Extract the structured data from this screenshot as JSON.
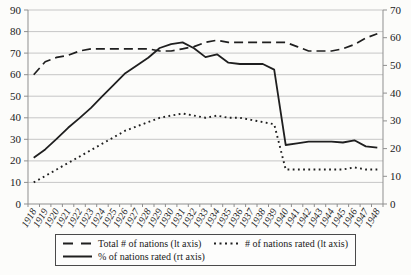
{
  "chart_data": {
    "type": "line",
    "x": [
      1918,
      1919,
      1920,
      1921,
      1922,
      1923,
      1924,
      1925,
      1926,
      1927,
      1928,
      1929,
      1930,
      1931,
      1932,
      1933,
      1934,
      1935,
      1936,
      1937,
      1938,
      1939,
      1940,
      1941,
      1942,
      1943,
      1944,
      1945,
      1946,
      1947,
      1948
    ],
    "series": [
      {
        "name": "Total # of nations (lt axis)",
        "axis": "left",
        "style": "dashed",
        "values": [
          60,
          66,
          68,
          69,
          71,
          72,
          72,
          72,
          72,
          72,
          72,
          71,
          71,
          72,
          73,
          75,
          76,
          75,
          75,
          75,
          75,
          75,
          75,
          73,
          71,
          71,
          71,
          72,
          74,
          77,
          79
        ]
      },
      {
        "name": "# of nations rated (lt axis)",
        "axis": "left",
        "style": "dotted",
        "values": [
          10,
          13,
          16,
          19,
          22,
          25,
          28,
          31,
          34,
          36,
          38,
          40,
          41,
          42,
          41,
          40,
          41,
          40,
          40,
          39,
          38,
          37,
          16,
          16,
          16,
          16,
          16,
          16,
          17,
          16,
          16
        ]
      },
      {
        "name": "% of nations rated (rt axis)",
        "axis": "right",
        "style": "solid",
        "values": [
          16.7,
          19.7,
          23.5,
          27.5,
          31.0,
          34.7,
          38.9,
          43.1,
          47.2,
          50.0,
          52.8,
          56.3,
          57.7,
          58.3,
          56.2,
          53.0,
          54.0,
          51.0,
          50.5,
          50.5,
          50.5,
          48.5,
          21.3,
          21.9,
          22.5,
          22.5,
          22.5,
          22.2,
          23.0,
          20.8,
          20.3
        ]
      }
    ],
    "left_axis": {
      "min": 0,
      "max": 90,
      "step": 10,
      "ticks": [
        0,
        10,
        20,
        30,
        40,
        50,
        60,
        70,
        80,
        90
      ]
    },
    "right_axis": {
      "min": 0,
      "max": 70,
      "step": 10,
      "ticks": [
        0,
        10,
        20,
        30,
        40,
        50,
        60,
        70
      ]
    },
    "grid": true,
    "legend_position": "bottom"
  },
  "colors": {
    "series": "#1f1f1f",
    "grid": "#c6c6c6",
    "axis": "#8f8f8f",
    "text": "#1a1a1a",
    "background": "#fcfcfa"
  }
}
